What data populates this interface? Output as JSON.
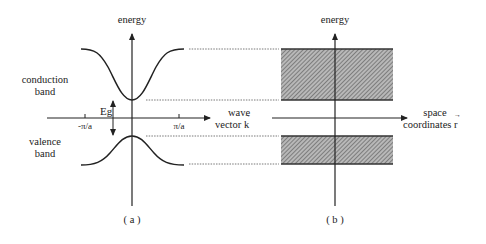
{
  "colors": {
    "ink": "#222222",
    "dotted": "#555555",
    "hatch": "#666666",
    "background": "#ffffff"
  },
  "panel_a": {
    "y_axis_label": "energy",
    "x_axis_label_line1": "wave",
    "x_axis_label_line2": "vector k",
    "x_axis_vector_symbol": "k",
    "tick_neg": "-π/a",
    "tick_pos": "π/a",
    "gap_label": "Eg",
    "conduction_label_line1": "conduction",
    "conduction_label_line2": "band",
    "valence_label_line1": "valence",
    "valence_label_line2": "band",
    "caption": "( a )"
  },
  "panel_b": {
    "y_axis_label": "energy",
    "x_axis_label_line1": "space",
    "x_axis_label_line2": "coordinates r",
    "x_axis_vector_symbol": "r",
    "caption": "( b )"
  },
  "diagram": {
    "bands": [
      {
        "name": "conduction band",
        "top_y": 49,
        "bottom_y": 100
      },
      {
        "name": "valence band",
        "top_y": 136,
        "bottom_y": 164
      }
    ]
  }
}
